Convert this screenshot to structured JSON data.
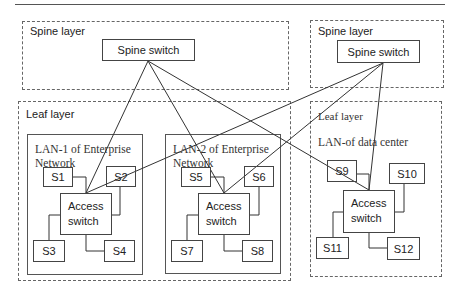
{
  "diagram": {
    "spine_left": {
      "label": "Spine layer",
      "switch": "Spine switch"
    },
    "spine_right": {
      "label": "Spine layer",
      "switch": "Spine switch"
    },
    "leaf_left": {
      "label": "Leaf layer",
      "lan1": {
        "title": "LAN-1 of Enterprise Network",
        "switch_line1": "Access",
        "switch_line2": "switch",
        "servers": [
          "S1",
          "S2",
          "S3",
          "S4"
        ]
      },
      "lan2": {
        "title": "LAN-2 of Enterprise Network",
        "switch_line1": "Access",
        "switch_line2": "switch",
        "servers": [
          "S5",
          "S6",
          "S7",
          "S8"
        ]
      }
    },
    "leaf_right": {
      "label": "Leaf layer",
      "dc": {
        "title": "LAN-of data center",
        "switch_line1": "Access",
        "switch_line2": "switch",
        "servers": [
          "S9",
          "S10",
          "S11",
          "S12"
        ]
      }
    },
    "links": [
      [
        "spine_left",
        "access_lan1"
      ],
      [
        "spine_left",
        "access_lan2"
      ],
      [
        "spine_left",
        "access_dc"
      ],
      [
        "spine_right",
        "access_lan1"
      ],
      [
        "spine_right",
        "access_lan2"
      ],
      [
        "spine_right",
        "access_dc"
      ]
    ]
  }
}
